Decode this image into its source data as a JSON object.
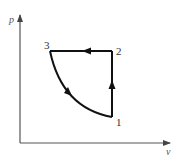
{
  "diagram": {
    "type": "p-v thermodynamic cycle",
    "axes": {
      "y_label": "p",
      "x_label": "v"
    },
    "points": [
      {
        "id": "1",
        "label": "1"
      },
      {
        "id": "2",
        "label": "2"
      },
      {
        "id": "3",
        "label": "3"
      }
    ],
    "processes": [
      {
        "from": "1",
        "to": "2",
        "shape": "vertical line (constant volume)",
        "direction": "up"
      },
      {
        "from": "2",
        "to": "3",
        "shape": "horizontal line (constant pressure)",
        "direction": "left"
      },
      {
        "from": "3",
        "to": "1",
        "shape": "curve",
        "direction": "down-right"
      }
    ],
    "colors": {
      "cycle": "#111111",
      "axes": "#555555"
    }
  }
}
